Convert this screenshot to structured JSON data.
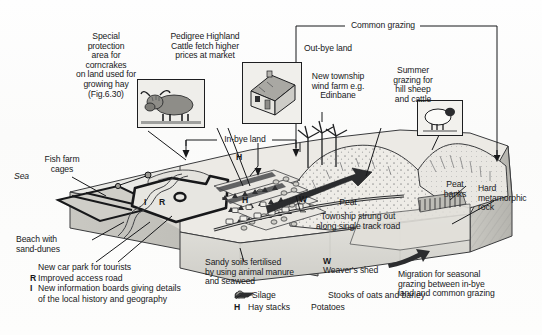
{
  "figure": {
    "type": "annotated-block-diagram"
  },
  "annotations": {
    "special_protection": "Special\nprotection\narea for\ncorncrakes\non land used for\ngrowing hay\n(Fig.6.30)",
    "highland_cattle": "Pedigree Highland\nCattle fetch higher\nprices at market",
    "common_grazing": "Common grazing",
    "out_bye_land": "Out-bye land",
    "in_bye_land": "In-bye land",
    "wind_farm": "New township\nwind farm e.g.\nEdinbane",
    "summer_grazing": "Summer\ngrazing for\nhill sheep\nand cattle",
    "fish_farm": "Fish farm\ncages",
    "sea": "Sea",
    "beach": "Beach with\nsand-dunes",
    "peat": "Peat",
    "peat_banks": "Peat\nbanks",
    "hard_rock": "Hard\nmetamorphic\nrock",
    "township": "Township strung out\nalong single track road",
    "sandy_soils": "Sandy soils fertilised\nby using animal manure\nand seaweed",
    "migration": "Migration for seasonal\ngrazing between in-bye\nland and common grazing",
    "weavers_shed_letter": "W",
    "weavers_shed_text": "Weaver's shed",
    "map_letter_h": "H",
    "map_letter_h2": "H",
    "map_letter_i": "I",
    "map_letter_r": "R",
    "map_letter_w": "W"
  },
  "key": {
    "tourist_items": [
      {
        "letter": "",
        "text": "New car park for tourists"
      },
      {
        "letter": "R",
        "text": "Improved access road"
      },
      {
        "letter": "I",
        "text": "New information boards giving details\nof the local history and geography"
      }
    ],
    "symbol_items": [
      {
        "letter": "",
        "symbol": "silage-icon",
        "text": "Silage"
      },
      {
        "letter": "",
        "symbol": "stooks-icon",
        "text": "Stooks of oats and barley"
      },
      {
        "letter": "H",
        "symbol": "haystack-icon",
        "text": "Hay stacks"
      },
      {
        "letter": "",
        "symbol": "potatoes-icon",
        "text": "Potatoes"
      }
    ]
  },
  "insets": [
    {
      "name": "highland-cattle-photo",
      "caption": "Highland cattle"
    },
    {
      "name": "croft-house-photo",
      "caption": "Croft house"
    },
    {
      "name": "hill-sheep-photo",
      "caption": "Hill sheep"
    }
  ],
  "colors": {
    "ink": "#18191b",
    "land_light": "#efeeea",
    "land_mid": "#d9d8d3",
    "land_dark": "#b9b8b2",
    "rock": "#cdccc6",
    "sea": "#e7e7e3"
  }
}
